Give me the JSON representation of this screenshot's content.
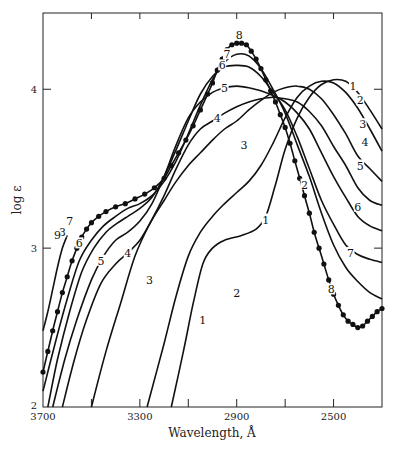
{
  "chart_data": {
    "type": "line",
    "title": "",
    "xlabel": "Wavelength, Å",
    "ylabel": "log ε",
    "xlim": [
      3700,
      2300
    ],
    "ylim": [
      2,
      4.48
    ],
    "x_reversed": true,
    "x_ticks": [
      3700,
      3500,
      3300,
      3100,
      2900,
      2700,
      2500,
      2300
    ],
    "x_tick_labels": [
      "3700",
      "",
      "3300",
      "",
      "2900",
      "",
      "2500",
      ""
    ],
    "y_ticks": [
      2,
      3,
      4
    ],
    "y_tick_labels": [
      "2",
      "3",
      "4"
    ],
    "grid": false,
    "legend": "none (curves labeled inline 1–9)",
    "series": [
      {
        "name": "1",
        "marker": "none",
        "label_at": [
          [
            2780,
            3.18
          ],
          [
            2420,
            4.02
          ],
          [
            3040,
            2.55
          ]
        ],
        "points": [
          [
            3170,
            2.0
          ],
          [
            3120,
            2.35
          ],
          [
            3080,
            2.65
          ],
          [
            3040,
            2.9
          ],
          [
            3000,
            3.0
          ],
          [
            2950,
            3.05
          ],
          [
            2880,
            3.08
          ],
          [
            2820,
            3.12
          ],
          [
            2780,
            3.2
          ],
          [
            2740,
            3.4
          ],
          [
            2700,
            3.62
          ],
          [
            2650,
            3.82
          ],
          [
            2600,
            3.95
          ],
          [
            2550,
            4.03
          ],
          [
            2500,
            4.06
          ],
          [
            2450,
            4.05
          ],
          [
            2400,
            3.98
          ],
          [
            2350,
            3.87
          ],
          [
            2300,
            3.75
          ]
        ]
      },
      {
        "name": "2",
        "marker": "none",
        "label_at": [
          [
            2900,
            2.72
          ],
          [
            2620,
            3.4
          ],
          [
            2390,
            3.93
          ]
        ],
        "points": [
          [
            3270,
            2.0
          ],
          [
            3200,
            2.4
          ],
          [
            3150,
            2.7
          ],
          [
            3100,
            2.95
          ],
          [
            3050,
            3.1
          ],
          [
            3000,
            3.2
          ],
          [
            2950,
            3.28
          ],
          [
            2900,
            3.35
          ],
          [
            2850,
            3.42
          ],
          [
            2800,
            3.52
          ],
          [
            2750,
            3.66
          ],
          [
            2700,
            3.82
          ],
          [
            2650,
            3.95
          ],
          [
            2600,
            4.02
          ],
          [
            2550,
            4.05
          ],
          [
            2500,
            4.04
          ],
          [
            2450,
            3.98
          ],
          [
            2400,
            3.88
          ],
          [
            2350,
            3.75
          ],
          [
            2300,
            3.61
          ]
        ]
      },
      {
        "name": "3",
        "marker": "none",
        "label_at": [
          [
            3260,
            2.8
          ],
          [
            2870,
            3.65
          ],
          [
            2380,
            3.78
          ]
        ],
        "points": [
          [
            3500,
            2.0
          ],
          [
            3440,
            2.35
          ],
          [
            3380,
            2.65
          ],
          [
            3320,
            2.95
          ],
          [
            3260,
            3.15
          ],
          [
            3200,
            3.3
          ],
          [
            3150,
            3.42
          ],
          [
            3100,
            3.52
          ],
          [
            3050,
            3.6
          ],
          [
            3000,
            3.68
          ],
          [
            2950,
            3.75
          ],
          [
            2900,
            3.8
          ],
          [
            2850,
            3.87
          ],
          [
            2800,
            3.93
          ],
          [
            2750,
            3.98
          ],
          [
            2700,
            4.01
          ],
          [
            2650,
            4.02
          ],
          [
            2600,
            4.0
          ],
          [
            2550,
            3.94
          ],
          [
            2500,
            3.84
          ],
          [
            2450,
            3.72
          ],
          [
            2400,
            3.58
          ],
          [
            2350,
            3.5
          ],
          [
            2300,
            3.42
          ]
        ]
      },
      {
        "name": "4",
        "marker": "none",
        "label_at": [
          [
            3350,
            2.97
          ],
          [
            2980,
            3.82
          ],
          [
            2370,
            3.67
          ]
        ],
        "points": [
          [
            3620,
            2.0
          ],
          [
            3570,
            2.3
          ],
          [
            3520,
            2.55
          ],
          [
            3460,
            2.78
          ],
          [
            3400,
            2.9
          ],
          [
            3350,
            2.97
          ],
          [
            3300,
            3.05
          ],
          [
            3250,
            3.18
          ],
          [
            3200,
            3.33
          ],
          [
            3150,
            3.5
          ],
          [
            3100,
            3.65
          ],
          [
            3050,
            3.75
          ],
          [
            3000,
            3.8
          ],
          [
            2950,
            3.85
          ],
          [
            2900,
            3.89
          ],
          [
            2850,
            3.92
          ],
          [
            2800,
            3.94
          ],
          [
            2750,
            3.95
          ],
          [
            2700,
            3.94
          ],
          [
            2650,
            3.92
          ],
          [
            2600,
            3.86
          ],
          [
            2550,
            3.77
          ],
          [
            2500,
            3.64
          ],
          [
            2450,
            3.52
          ],
          [
            2400,
            3.38
          ],
          [
            2350,
            3.3
          ],
          [
            2300,
            3.27
          ]
        ]
      },
      {
        "name": "5",
        "marker": "none",
        "label_at": [
          [
            3460,
            2.92
          ],
          [
            2950,
            4.01
          ],
          [
            2390,
            3.52
          ]
        ],
        "points": [
          [
            3660,
            2.0
          ],
          [
            3610,
            2.3
          ],
          [
            3560,
            2.55
          ],
          [
            3500,
            2.8
          ],
          [
            3450,
            2.95
          ],
          [
            3400,
            3.05
          ],
          [
            3350,
            3.1
          ],
          [
            3300,
            3.17
          ],
          [
            3250,
            3.28
          ],
          [
            3200,
            3.45
          ],
          [
            3150,
            3.65
          ],
          [
            3100,
            3.82
          ],
          [
            3050,
            3.92
          ],
          [
            3000,
            3.98
          ],
          [
            2950,
            4.01
          ],
          [
            2900,
            4.02
          ],
          [
            2850,
            4.01
          ],
          [
            2800,
            3.99
          ],
          [
            2750,
            3.96
          ],
          [
            2700,
            3.92
          ],
          [
            2650,
            3.85
          ],
          [
            2600,
            3.75
          ],
          [
            2550,
            3.6
          ],
          [
            2500,
            3.45
          ],
          [
            2450,
            3.32
          ],
          [
            2400,
            3.2
          ],
          [
            2350,
            3.14
          ],
          [
            2300,
            3.11
          ]
        ]
      },
      {
        "name": "6",
        "marker": "none",
        "label_at": [
          [
            3550,
            3.03
          ],
          [
            2960,
            4.15
          ],
          [
            2400,
            3.26
          ]
        ],
        "points": [
          [
            3680,
            2.0
          ],
          [
            3640,
            2.3
          ],
          [
            3590,
            2.6
          ],
          [
            3540,
            2.85
          ],
          [
            3490,
            3.0
          ],
          [
            3440,
            3.1
          ],
          [
            3400,
            3.15
          ],
          [
            3350,
            3.2
          ],
          [
            3300,
            3.25
          ],
          [
            3250,
            3.32
          ],
          [
            3200,
            3.45
          ],
          [
            3150,
            3.62
          ],
          [
            3100,
            3.8
          ],
          [
            3050,
            3.97
          ],
          [
            3000,
            4.08
          ],
          [
            2950,
            4.14
          ],
          [
            2900,
            4.15
          ],
          [
            2850,
            4.14
          ],
          [
            2800,
            4.08
          ],
          [
            2750,
            3.98
          ],
          [
            2700,
            3.87
          ],
          [
            2650,
            3.7
          ],
          [
            2600,
            3.5
          ],
          [
            2550,
            3.3
          ],
          [
            2500,
            3.15
          ],
          [
            2450,
            3.02
          ],
          [
            2400,
            2.96
          ],
          [
            2350,
            2.93
          ],
          [
            2300,
            2.91
          ]
        ]
      },
      {
        "name": "7",
        "marker": "none",
        "label_at": [
          [
            3590,
            3.17
          ],
          [
            2940,
            4.22
          ],
          [
            2430,
            2.97
          ]
        ],
        "points": [
          [
            3700,
            2.1
          ],
          [
            3650,
            2.4
          ],
          [
            3600,
            2.68
          ],
          [
            3550,
            2.92
          ],
          [
            3500,
            3.05
          ],
          [
            3450,
            3.14
          ],
          [
            3400,
            3.2
          ],
          [
            3350,
            3.25
          ],
          [
            3300,
            3.28
          ],
          [
            3250,
            3.33
          ],
          [
            3200,
            3.42
          ],
          [
            3150,
            3.55
          ],
          [
            3100,
            3.72
          ],
          [
            3050,
            3.9
          ],
          [
            3000,
            4.06
          ],
          [
            2950,
            4.17
          ],
          [
            2900,
            4.22
          ],
          [
            2850,
            4.21
          ],
          [
            2800,
            4.13
          ],
          [
            2750,
            4.0
          ],
          [
            2700,
            3.85
          ],
          [
            2650,
            3.65
          ],
          [
            2600,
            3.45
          ],
          [
            2550,
            3.22
          ],
          [
            2500,
            3.02
          ],
          [
            2450,
            2.88
          ],
          [
            2400,
            2.79
          ],
          [
            2350,
            2.72
          ],
          [
            2300,
            2.68
          ]
        ]
      },
      {
        "name": "8",
        "marker": "dot",
        "label_at": [
          [
            3620,
            3.1
          ],
          [
            2890,
            4.34
          ],
          [
            2510,
            2.74
          ]
        ],
        "points": [
          [
            3700,
            2.22
          ],
          [
            3680,
            2.35
          ],
          [
            3660,
            2.48
          ],
          [
            3640,
            2.6
          ],
          [
            3620,
            2.72
          ],
          [
            3600,
            2.82
          ],
          [
            3580,
            2.92
          ],
          [
            3560,
            3.0
          ],
          [
            3540,
            3.07
          ],
          [
            3520,
            3.12
          ],
          [
            3500,
            3.16
          ],
          [
            3470,
            3.2
          ],
          [
            3440,
            3.23
          ],
          [
            3400,
            3.26
          ],
          [
            3360,
            3.28
          ],
          [
            3320,
            3.31
          ],
          [
            3280,
            3.34
          ],
          [
            3240,
            3.38
          ],
          [
            3200,
            3.44
          ],
          [
            3170,
            3.52
          ],
          [
            3140,
            3.6
          ],
          [
            3110,
            3.68
          ],
          [
            3080,
            3.77
          ],
          [
            3050,
            3.87
          ],
          [
            3020,
            3.97
          ],
          [
            3000,
            4.04
          ],
          [
            2980,
            4.12
          ],
          [
            2960,
            4.19
          ],
          [
            2940,
            4.25
          ],
          [
            2920,
            4.28
          ],
          [
            2900,
            4.29
          ],
          [
            2880,
            4.29
          ],
          [
            2860,
            4.28
          ],
          [
            2840,
            4.24
          ],
          [
            2820,
            4.19
          ],
          [
            2800,
            4.13
          ],
          [
            2780,
            4.06
          ],
          [
            2760,
            3.99
          ],
          [
            2740,
            3.92
          ],
          [
            2720,
            3.84
          ],
          [
            2700,
            3.76
          ],
          [
            2680,
            3.66
          ],
          [
            2660,
            3.55
          ],
          [
            2640,
            3.44
          ],
          [
            2620,
            3.33
          ],
          [
            2600,
            3.22
          ],
          [
            2580,
            3.1
          ],
          [
            2560,
            3.0
          ],
          [
            2540,
            2.9
          ],
          [
            2520,
            2.8
          ],
          [
            2500,
            2.71
          ],
          [
            2480,
            2.64
          ],
          [
            2460,
            2.58
          ],
          [
            2440,
            2.54
          ],
          [
            2420,
            2.52
          ],
          [
            2400,
            2.5
          ],
          [
            2380,
            2.51
          ],
          [
            2360,
            2.54
          ],
          [
            2340,
            2.57
          ],
          [
            2320,
            2.6
          ],
          [
            2300,
            2.62
          ]
        ]
      },
      {
        "name": "9",
        "marker": "none",
        "label_at": [
          [
            3640,
            3.08
          ]
        ],
        "points": [
          [
            3700,
            2.48
          ],
          [
            3680,
            2.6
          ],
          [
            3660,
            2.74
          ],
          [
            3640,
            2.88
          ],
          [
            3620,
            3.0
          ],
          [
            3600,
            3.08
          ]
        ]
      }
    ]
  }
}
